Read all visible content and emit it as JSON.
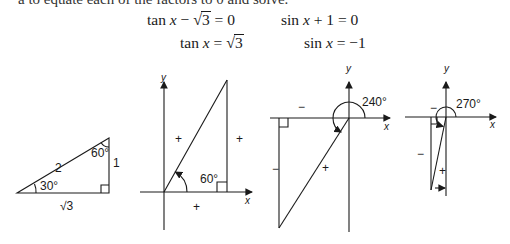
{
  "page": {
    "cut_off_line": "a to equate each of the factors to 0 and solve."
  },
  "equations": {
    "left": {
      "line1_prefix": "tan",
      "line1_var": "x",
      "line1_op": "−",
      "line1_radicand": "3",
      "line1_suffix": "= 0",
      "line2_prefix": "tan",
      "line2_var": "x",
      "line2_eq": "=",
      "line2_radicand": "3"
    },
    "right": {
      "line1_prefix": "sin",
      "line1_var": "x",
      "line1_suffix": "+ 1 = 0",
      "line2_prefix": "sin",
      "line2_var": "x",
      "line2_suffix": "= −1"
    }
  },
  "figures": {
    "triangle": {
      "hypotenuse": "2",
      "opposite": "1",
      "adjacent": "√3",
      "angle_bottom": "30°",
      "angle_top": "60°"
    },
    "quadrant_60": {
      "angle": "60°",
      "x_label": "x",
      "y_label": "y",
      "signs": [
        "+",
        "+",
        "+"
      ]
    },
    "quadrant_240": {
      "angle": "240°",
      "x_label": "x",
      "y_label": "y",
      "signs": [
        "−",
        "−",
        "+"
      ]
    },
    "quadrant_270": {
      "angle": "270°",
      "x_label": "x",
      "y_label": "y",
      "signs": [
        "−",
        "−",
        "+"
      ]
    }
  }
}
